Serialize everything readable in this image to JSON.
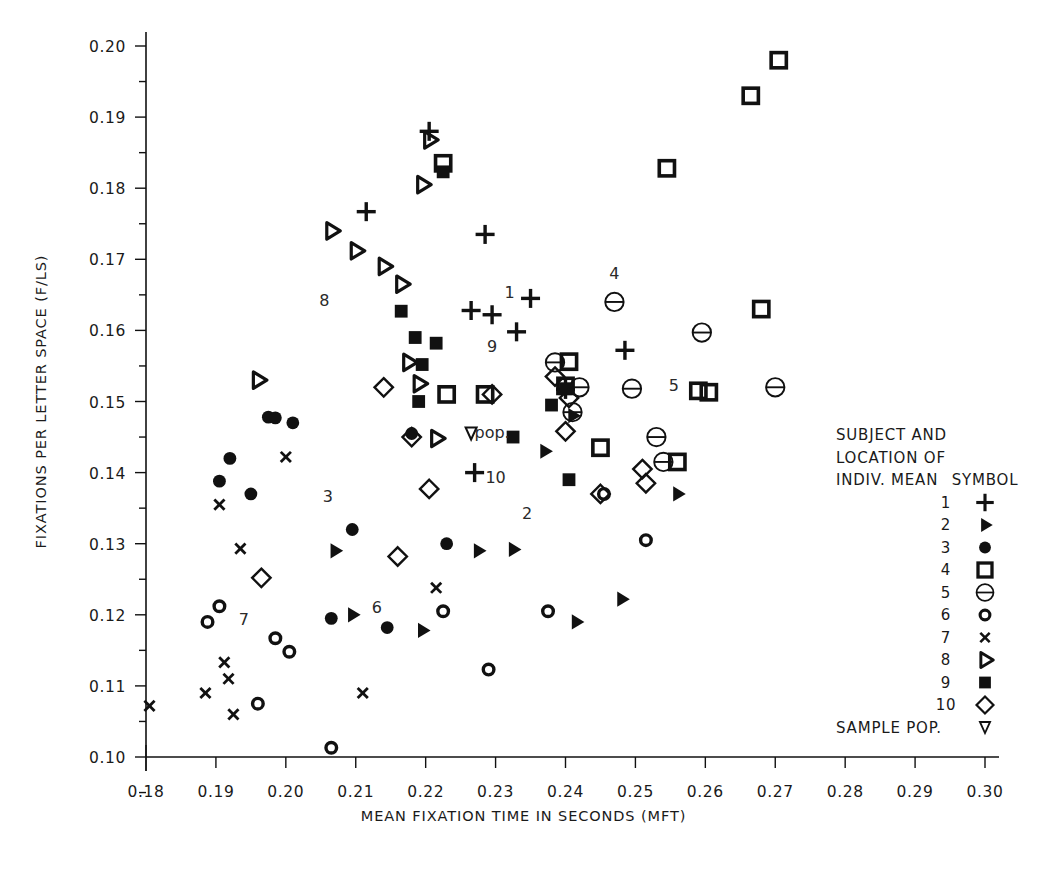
{
  "chart_data": {
    "type": "scatter",
    "title": "",
    "xlabel": "MEAN FIXATION TIME IN SECONDS (MFT)",
    "ylabel": "FIXATIONS PER LETTER SPACE (F/LS)",
    "xlim": [
      0.175,
      0.305
    ],
    "ylim": [
      0.0955,
      0.2025
    ],
    "xticks": [
      "0.18",
      "0.19",
      "0.20",
      "0.21",
      "0.22",
      "0.23",
      "0.24",
      "0.25",
      "0.26",
      "0.27",
      "0.28",
      "0.29",
      "0.30"
    ],
    "xtick_values": [
      0.18,
      0.19,
      0.2,
      0.21,
      0.22,
      0.23,
      0.24,
      0.25,
      0.26,
      0.27,
      0.28,
      0.29,
      0.3
    ],
    "yticks": [
      "0.10",
      "0.11",
      "0.12",
      "0.13",
      "0.14",
      "0.15",
      "0.16",
      "0.17",
      "0.18",
      "0.19",
      "0.20"
    ],
    "ytick_values": [
      0.1,
      0.11,
      0.12,
      0.13,
      0.14,
      0.15,
      0.16,
      0.17,
      0.18,
      0.19,
      0.2
    ],
    "minor_ticks": true,
    "grid": false,
    "legend_position": "right-inside",
    "series": [
      {
        "name": "1",
        "symbol": "plus",
        "points": [
          [
            0.2115,
            0.1767
          ],
          [
            0.2205,
            0.188
          ],
          [
            0.2285,
            0.1735
          ],
          [
            0.2265,
            0.1628
          ],
          [
            0.2295,
            0.1622
          ],
          [
            0.235,
            0.1645
          ],
          [
            0.233,
            0.1598
          ],
          [
            0.24,
            0.1517
          ],
          [
            0.2485,
            0.1572
          ],
          [
            0.227,
            0.14
          ]
        ]
      },
      {
        "name": "2",
        "symbol": "right-triangle-filled",
        "points": [
          [
            0.207,
            0.129
          ],
          [
            0.2095,
            0.12
          ],
          [
            0.2195,
            0.1178
          ],
          [
            0.2275,
            0.129
          ],
          [
            0.2325,
            0.1292
          ],
          [
            0.241,
            0.148
          ],
          [
            0.2415,
            0.119
          ],
          [
            0.248,
            0.1222
          ],
          [
            0.256,
            0.137
          ],
          [
            0.237,
            0.143
          ]
        ]
      },
      {
        "name": "3",
        "symbol": "circle-filled",
        "points": [
          [
            0.1905,
            0.1388
          ],
          [
            0.192,
            0.142
          ],
          [
            0.195,
            0.137
          ],
          [
            0.1975,
            0.1478
          ],
          [
            0.1985,
            0.1477
          ],
          [
            0.201,
            0.147
          ],
          [
            0.2065,
            0.1195
          ],
          [
            0.2095,
            0.132
          ],
          [
            0.2145,
            0.1182
          ],
          [
            0.218,
            0.1455
          ],
          [
            0.223,
            0.13
          ]
        ]
      },
      {
        "name": "4",
        "symbol": "square-open",
        "points": [
          [
            0.223,
            0.151
          ],
          [
            0.2225,
            0.1835
          ],
          [
            0.2285,
            0.151
          ],
          [
            0.2405,
            0.1556
          ],
          [
            0.24,
            0.1522
          ],
          [
            0.245,
            0.1435
          ],
          [
            0.2545,
            0.1828
          ],
          [
            0.256,
            0.1415
          ],
          [
            0.259,
            0.1515
          ],
          [
            0.2605,
            0.1513
          ],
          [
            0.2665,
            0.193
          ],
          [
            0.268,
            0.163
          ],
          [
            0.2705,
            0.198
          ]
        ]
      },
      {
        "name": "5",
        "symbol": "circle-minus",
        "points": [
          [
            0.2385,
            0.1555
          ],
          [
            0.241,
            0.1485
          ],
          [
            0.242,
            0.152
          ],
          [
            0.247,
            0.164
          ],
          [
            0.2495,
            0.1518
          ],
          [
            0.253,
            0.145
          ],
          [
            0.254,
            0.1415
          ],
          [
            0.2595,
            0.1597
          ],
          [
            0.27,
            0.152
          ]
        ]
      },
      {
        "name": "6",
        "symbol": "circle-open",
        "points": [
          [
            0.1888,
            0.119
          ],
          [
            0.1905,
            0.1212
          ],
          [
            0.196,
            0.1075
          ],
          [
            0.1985,
            0.1167
          ],
          [
            0.2005,
            0.1148
          ],
          [
            0.2065,
            0.1013
          ],
          [
            0.2225,
            0.1205
          ],
          [
            0.229,
            0.1123
          ],
          [
            0.2375,
            0.1205
          ],
          [
            0.2455,
            0.137
          ],
          [
            0.2515,
            0.1305
          ]
        ]
      },
      {
        "name": "7",
        "symbol": "x",
        "points": [
          [
            0.1805,
            0.1072
          ],
          [
            0.1885,
            0.109
          ],
          [
            0.1905,
            0.1355
          ],
          [
            0.1912,
            0.1133
          ],
          [
            0.1918,
            0.111
          ],
          [
            0.1925,
            0.106
          ],
          [
            0.1935,
            0.1293
          ],
          [
            0.2,
            0.1422
          ],
          [
            0.211,
            0.109
          ],
          [
            0.2215,
            0.1238
          ]
        ]
      },
      {
        "name": "8",
        "symbol": "right-triangle-open",
        "points": [
          [
            0.196,
            0.153
          ],
          [
            0.2065,
            0.174
          ],
          [
            0.21,
            0.1712
          ],
          [
            0.214,
            0.169
          ],
          [
            0.2165,
            0.1665
          ],
          [
            0.2175,
            0.1555
          ],
          [
            0.2205,
            0.1868
          ],
          [
            0.219,
            0.1525
          ],
          [
            0.2195,
            0.1805
          ],
          [
            0.2215,
            0.1448
          ]
        ]
      },
      {
        "name": "9",
        "symbol": "square-filled",
        "points": [
          [
            0.2165,
            0.1627
          ],
          [
            0.2185,
            0.159
          ],
          [
            0.2215,
            0.1582
          ],
          [
            0.2195,
            0.1552
          ],
          [
            0.219,
            0.15
          ],
          [
            0.2225,
            0.1823
          ],
          [
            0.2325,
            0.145
          ],
          [
            0.238,
            0.1495
          ],
          [
            0.24,
            0.1518
          ],
          [
            0.2405,
            0.139
          ]
        ]
      },
      {
        "name": "10",
        "symbol": "diamond-open",
        "points": [
          [
            0.1965,
            0.1252
          ],
          [
            0.214,
            0.152
          ],
          [
            0.216,
            0.1282
          ],
          [
            0.218,
            0.145
          ],
          [
            0.2205,
            0.1377
          ],
          [
            0.2295,
            0.151
          ],
          [
            0.2385,
            0.1535
          ],
          [
            0.2405,
            0.1505
          ],
          [
            0.24,
            0.1458
          ],
          [
            0.245,
            0.137
          ],
          [
            0.251,
            0.1405
          ],
          [
            0.2515,
            0.1385
          ]
        ]
      }
    ],
    "annotations": [
      {
        "text": "1",
        "x": 0.232,
        "y": 0.1645,
        "ref": "subject-1-mean"
      },
      {
        "text": "2",
        "x": 0.2345,
        "y": 0.1335,
        "ref": "subject-2-mean"
      },
      {
        "text": "3",
        "x": 0.206,
        "y": 0.1358,
        "ref": "subject-3-mean"
      },
      {
        "text": "4",
        "x": 0.247,
        "y": 0.1672,
        "ref": "subject-4-mean"
      },
      {
        "text": "5",
        "x": 0.2555,
        "y": 0.1515,
        "ref": "subject-5-mean"
      },
      {
        "text": "6",
        "x": 0.213,
        "y": 0.1202,
        "ref": "subject-6-mean"
      },
      {
        "text": "7",
        "x": 0.194,
        "y": 0.1185,
        "ref": "subject-7-mean"
      },
      {
        "text": "8",
        "x": 0.2055,
        "y": 0.1635,
        "ref": "subject-8-mean"
      },
      {
        "text": "9",
        "x": 0.2295,
        "y": 0.157,
        "ref": "subject-9-mean"
      },
      {
        "text": "10",
        "x": 0.23,
        "y": 0.1385,
        "ref": "subject-10-mean"
      },
      {
        "text": "pop.",
        "x": 0.2295,
        "y": 0.1448,
        "ref": "sample-population-mean"
      }
    ],
    "population_marker": {
      "symbol": "down-triangle-open",
      "x": 0.2265,
      "y": 0.1455
    }
  },
  "legend": {
    "header_lines": [
      "SUBJECT AND",
      "LOCATION OF"
    ],
    "header_left": "INDIV. MEAN",
    "header_right": "SYMBOL",
    "rows": [
      {
        "label": "1",
        "symbol": "plus"
      },
      {
        "label": "2",
        "symbol": "right-triangle-filled"
      },
      {
        "label": "3",
        "symbol": "circle-filled"
      },
      {
        "label": "4",
        "symbol": "square-open"
      },
      {
        "label": "5",
        "symbol": "circle-minus"
      },
      {
        "label": "6",
        "symbol": "circle-open"
      },
      {
        "label": "7",
        "symbol": "x"
      },
      {
        "label": "8",
        "symbol": "right-triangle-open"
      },
      {
        "label": "9",
        "symbol": "square-filled"
      },
      {
        "label": "10",
        "symbol": "diamond-open"
      },
      {
        "label": "SAMPLE POP.",
        "symbol": "down-triangle-open"
      }
    ]
  },
  "colors": {
    "ink": "#111111",
    "background": "#ffffff",
    "label": "#2a2a2a"
  }
}
